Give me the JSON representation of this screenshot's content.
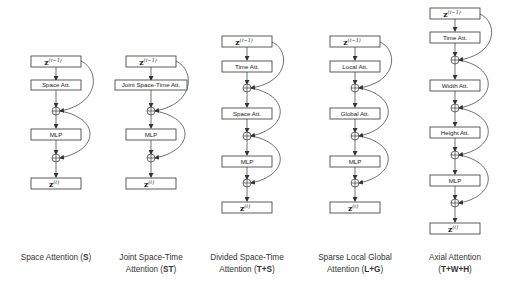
{
  "figure": {
    "diagrams": [
      {
        "id": "space",
        "input": "z",
        "input_sup": "(ℓ−1)",
        "blocks": [
          "Space Att.",
          "MLP"
        ],
        "output": "z",
        "output_sup": "(ℓ)",
        "caption_line1": "Space Attention (",
        "caption_bold": "S",
        "caption_end": ")",
        "caption_line2": ""
      },
      {
        "id": "joint",
        "input": "z",
        "input_sup": "(ℓ−1)",
        "blocks": [
          "Joint Space-Time Att.",
          "MLP"
        ],
        "output": "z",
        "output_sup": "(ℓ)",
        "caption_line1": "Joint Space-Time",
        "caption_line2_pre": "Attention (",
        "caption_bold": "ST",
        "caption_end": ")"
      },
      {
        "id": "divided",
        "input": "z",
        "input_sup": "(ℓ−1)",
        "blocks": [
          "Time Att.",
          "Space Att.",
          "MLP"
        ],
        "output": "z",
        "output_sup": "(ℓ)",
        "caption_line1": "Divided Space-Time",
        "caption_line2_pre": "Attention (",
        "caption_bold": "T+S",
        "caption_end": ")"
      },
      {
        "id": "sparse",
        "input": "z",
        "input_sup": "(ℓ−1)",
        "blocks": [
          "Local Att.",
          "Global Att.",
          "MLP"
        ],
        "output": "z",
        "output_sup": "(ℓ)",
        "caption_line1": "Sparse Local Global",
        "caption_line2_pre": "Attention (",
        "caption_bold": "L+G",
        "caption_end": ")"
      },
      {
        "id": "axial",
        "input": "z",
        "input_sup": "(ℓ−1)",
        "blocks": [
          "Time Att.",
          "Width Att.",
          "Height Att.",
          "MLP"
        ],
        "output": "z",
        "output_sup": "(ℓ)",
        "caption_line1": "Axial Attention",
        "caption_line2_pre": "(",
        "caption_bold": "T+W+H",
        "caption_end": ")"
      }
    ],
    "sum_symbol": "+"
  }
}
